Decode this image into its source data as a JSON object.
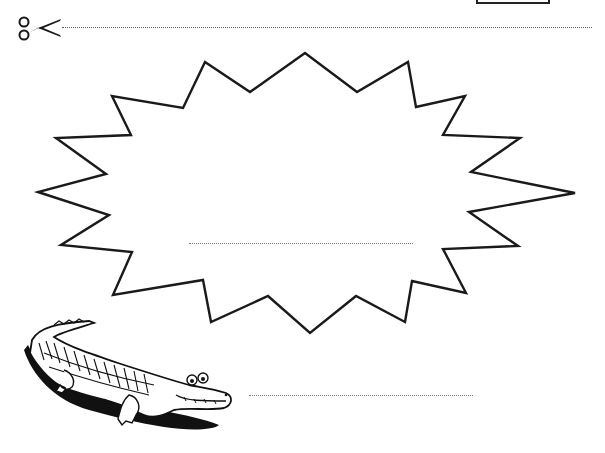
{
  "worksheet": {
    "cut_line": {
      "style": "dotted",
      "icon": "scissors-icon"
    },
    "burst_shape": {
      "points": 18,
      "stroke": "#1a1a1a",
      "fill": "#ffffff"
    },
    "writing_lines": [
      {
        "id": "inside-burst",
        "text": ""
      },
      {
        "id": "beside-crocodile",
        "text": ""
      }
    ],
    "illustration": {
      "subject": "crocodile"
    }
  },
  "colors": {
    "ink": "#1a1a1a",
    "dotted": "#777777",
    "background": "#ffffff"
  }
}
